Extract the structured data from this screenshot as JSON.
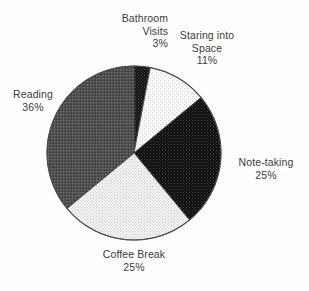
{
  "chart_data": {
    "type": "pie",
    "title": "",
    "subtitle": "",
    "xlabel": "",
    "ylabel": "",
    "legend_position": "none",
    "grid": false,
    "units": "percent",
    "start_angle_deg": 0,
    "direction": "clockwise",
    "center": {
      "x": 134,
      "y": 153
    },
    "radius": 87,
    "categories": [
      "Bathroom Visits",
      "Staring into Space",
      "Note-taking",
      "Coffee Break",
      "Reading"
    ],
    "values": [
      3,
      11,
      25,
      25,
      36
    ],
    "slices": [
      {
        "label": "Bathroom Visits",
        "label_line1": "Bathroom",
        "label_line2": "Visits",
        "value": 3,
        "value_text": "3%",
        "fill": "#1a1a1a",
        "pattern": "dense-dots-dark",
        "start_deg": 0,
        "end_deg": 10.8
      },
      {
        "label": "Staring into Space",
        "label_line1": "Staring into",
        "label_line2": "Space",
        "value": 11,
        "value_text": "11%",
        "fill": "#f2f2f2",
        "pattern": "sparse-dots-light",
        "start_deg": 10.8,
        "end_deg": 50.4
      },
      {
        "label": "Note-taking",
        "label_line1": "Note-taking",
        "label_line2": "",
        "value": 25,
        "value_text": "25%",
        "fill": "#151515",
        "pattern": "dense-dots-dark",
        "start_deg": 50.4,
        "end_deg": 140.4
      },
      {
        "label": "Coffee Break",
        "label_line1": "Coffee Break",
        "label_line2": "",
        "value": 25,
        "value_text": "25%",
        "fill": "#ececec",
        "pattern": "medium-dots-light",
        "start_deg": 140.4,
        "end_deg": 230.4
      },
      {
        "label": "Reading",
        "label_line1": "Reading",
        "label_line2": "",
        "value": 36,
        "value_text": "36%",
        "fill": "#585858",
        "pattern": "checker-gray",
        "start_deg": 230.4,
        "end_deg": 360
      }
    ],
    "colors": {
      "bathroom_visits": "#1a1a1a",
      "staring_into_space": "#f2f2f2",
      "note_taking": "#151515",
      "coffee_break": "#ececec",
      "reading": "#585858",
      "outline": "#4a4a4a",
      "background": "#fefefe",
      "text": "#3a3a3a"
    }
  }
}
